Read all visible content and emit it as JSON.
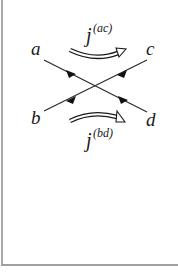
{
  "diagram": {
    "nodes": {
      "a": "a",
      "b": "b",
      "c": "c",
      "d": "d"
    },
    "edges": [
      {
        "from": "a",
        "to": "d",
        "arrowheads": 2
      },
      {
        "from": "b",
        "to": "c",
        "arrowheads": 2
      }
    ],
    "currents": {
      "top": {
        "base": "j",
        "superscript": "(ac)",
        "direction": "left-to-right"
      },
      "bottom": {
        "base": "j",
        "superscript": "(bd)",
        "direction": "left-to-right"
      }
    },
    "colors": {
      "line": "#2a2a2a",
      "frame": "#a8a8a8",
      "background": "#ffffff"
    }
  }
}
